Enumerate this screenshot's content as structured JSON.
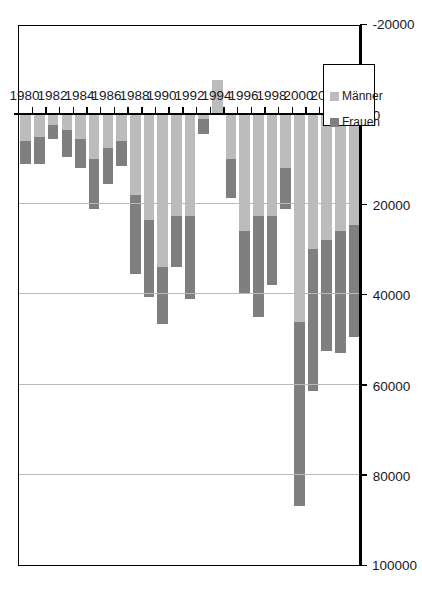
{
  "chart_data": {
    "type": "bar",
    "subtype": "stacked-horizontal",
    "orientation": "rotated-90",
    "title": "",
    "subtitle": "",
    "xlabel": "",
    "ylabel": "",
    "grid": true,
    "legend_position": "bottom-left",
    "value_axis": {
      "min": -20000,
      "max": 100000,
      "tick_step": 20000,
      "ticks": [
        100000,
        80000,
        60000,
        40000,
        20000,
        0,
        -20000
      ],
      "tick_labels": [
        "100000",
        "80000",
        "60000",
        "40000",
        "20000",
        "0",
        "-20000"
      ]
    },
    "category_axis": {
      "labels_every": 2,
      "tick_labels": [
        "1980",
        "1982",
        "1984",
        "1986",
        "1988",
        "1990",
        "1992",
        "1994",
        "1996",
        "1998",
        "2000",
        "2002",
        "2004"
      ]
    },
    "categories": [
      "1980",
      "1981",
      "1982",
      "1983",
      "1984",
      "1985",
      "1986",
      "1987",
      "1988",
      "1989",
      "1990",
      "1991",
      "1992",
      "1993",
      "1994",
      "1995",
      "1996",
      "1997",
      "1998",
      "1999",
      "2000",
      "2001",
      "2002",
      "2003",
      "2004"
    ],
    "series": [
      {
        "name": "Frauen",
        "color": "#7f7f7f",
        "values": [
          5000,
          6000,
          3000,
          6000,
          6500,
          11000,
          8000,
          5500,
          17500,
          17000,
          12500,
          11500,
          18500,
          3500,
          0,
          8500,
          14000,
          22500,
          15500,
          9000,
          41000,
          31500,
          24500,
          27000,
          25000
        ]
      },
      {
        "name": "Männer",
        "color": "#bcbcbc",
        "values": [
          6000,
          5000,
          2500,
          3500,
          5500,
          10000,
          7500,
          6000,
          18000,
          23500,
          34000,
          22500,
          22500,
          1000,
          -7500,
          10000,
          26000,
          22500,
          22500,
          12000,
          46000,
          30000,
          28000,
          26000,
          24500
        ]
      }
    ],
    "totals": [
      11000,
      11000,
      5500,
      9500,
      12000,
      21000,
      15500,
      11500,
      35500,
      40500,
      46500,
      34000,
      41000,
      4500,
      -7500,
      18500,
      40000,
      45000,
      38000,
      21000,
      87000,
      61500,
      52500,
      53000,
      49500
    ]
  },
  "legend": {
    "items": [
      {
        "label": "Frauen",
        "color": "#7f7f7f"
      },
      {
        "label": "Männer",
        "color": "#bcbcbc"
      }
    ]
  }
}
